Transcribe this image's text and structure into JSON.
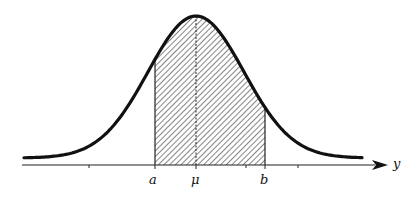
{
  "diagram": {
    "curve": {
      "mean_label": "μ",
      "color": "#111111"
    },
    "shaded_region": {
      "from_label": "a",
      "to_label": "b",
      "pattern": "diagonal-hatch"
    },
    "axis": {
      "label": "y",
      "tick_labels": [
        "a",
        "μ",
        "b"
      ]
    }
  },
  "chart_data": {
    "type": "area",
    "title": "",
    "xlabel": "y",
    "ylabel": "",
    "tick_labels": [
      "a",
      "μ",
      "b"
    ],
    "series": [
      {
        "name": "normal density",
        "shape": "bell curve",
        "shaded_between": [
          "a",
          "b"
        ]
      }
    ],
    "grid": false
  }
}
